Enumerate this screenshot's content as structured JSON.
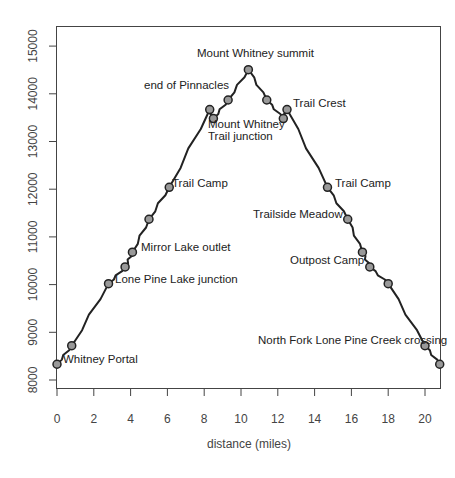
{
  "chart_data": {
    "type": "line",
    "title": "",
    "xlabel": "distance (miles)",
    "ylabel": "",
    "xlim": [
      0,
      20.8
    ],
    "ylim": [
      7700,
      15300
    ],
    "x_ticks": [
      0,
      2,
      4,
      6,
      8,
      10,
      12,
      14,
      16,
      18,
      20
    ],
    "y_ticks": [
      8000,
      9000,
      10000,
      11000,
      12000,
      13000,
      14000,
      15000
    ],
    "grid": false,
    "legend": null,
    "colors": {
      "line": "#222222",
      "marker_fill": "#999999",
      "marker_stroke": "#222222",
      "axis": "#444444"
    },
    "points": [
      {
        "x": 0.0,
        "y": 8330,
        "label": "Whitney Portal",
        "pos": "right"
      },
      {
        "x": 0.8,
        "y": 8720,
        "label": ""
      },
      {
        "x": 2.8,
        "y": 10020,
        "label": "Lone Pine Lake junction",
        "pos": "right"
      },
      {
        "x": 3.7,
        "y": 10370,
        "label": ""
      },
      {
        "x": 4.1,
        "y": 10680,
        "label": "Mirror Lake outlet",
        "pos": "right"
      },
      {
        "x": 5.0,
        "y": 11370,
        "label": ""
      },
      {
        "x": 6.1,
        "y": 12040,
        "label": "Trail Camp",
        "pos": "right"
      },
      {
        "x": 8.3,
        "y": 13670,
        "label": "end of Pinnacles",
        "pos": "left-up"
      },
      {
        "x": 8.5,
        "y": 13480,
        "label": "Mount Whitney Trail junction",
        "pos": "below"
      },
      {
        "x": 9.3,
        "y": 13870,
        "label": ""
      },
      {
        "x": 10.4,
        "y": 14505,
        "label": "Mount Whitney summit",
        "pos": "above"
      },
      {
        "x": 11.4,
        "y": 13870,
        "label": ""
      },
      {
        "x": 12.3,
        "y": 13480,
        "label": ""
      },
      {
        "x": 12.5,
        "y": 13670,
        "label": "Trail Crest",
        "pos": "right"
      },
      {
        "x": 14.7,
        "y": 12040,
        "label": "Trail Camp",
        "pos": "right"
      },
      {
        "x": 15.8,
        "y": 11370,
        "label": "Trailside Meadow",
        "pos": "left"
      },
      {
        "x": 16.6,
        "y": 10680,
        "label": ""
      },
      {
        "x": 17.0,
        "y": 10370,
        "label": "Outpost Camp",
        "pos": "left"
      },
      {
        "x": 18.0,
        "y": 10020,
        "label": ""
      },
      {
        "x": 20.0,
        "y": 8720,
        "label": "North Fork Lone Pine Creek crossing",
        "pos": "left"
      },
      {
        "x": 20.8,
        "y": 8330,
        "label": ""
      }
    ],
    "annotations": [
      "Whitney Portal",
      "Lone Pine Lake junction",
      "Mirror Lake outlet",
      "Trail Camp",
      "end of Pinnacles",
      "Mount Whitney",
      "Trail junction",
      "Mount Whitney summit",
      "Trail Crest",
      "Trail Camp",
      "Trailside Meadow",
      "Outpost Camp",
      "North Fork Lone Pine Creek crossing"
    ]
  },
  "labels": {
    "xlabel": "distance (miles)",
    "x_ticks": [
      "0",
      "2",
      "4",
      "6",
      "8",
      "10",
      "12",
      "14",
      "16",
      "18",
      "20"
    ],
    "y_ticks": [
      "8000",
      "9000",
      "10000",
      "11000",
      "12000",
      "13000",
      "14000",
      "15000"
    ],
    "ann": {
      "whitney_portal": "Whitney Portal",
      "lone_pine": "Lone Pine Lake junction",
      "mirror_lake": "Mirror Lake outlet",
      "trail_camp_up": "Trail Camp",
      "pinnacles": "end of Pinnacles",
      "mwtj_1": "Mount Whitney",
      "mwtj_2": "Trail junction",
      "summit": "Mount Whitney summit",
      "trail_crest": "Trail Crest",
      "trail_camp_down": "Trail Camp",
      "trailside": "Trailside Meadow",
      "outpost": "Outpost Camp",
      "north_fork": "North Fork Lone Pine Creek crossing"
    }
  }
}
